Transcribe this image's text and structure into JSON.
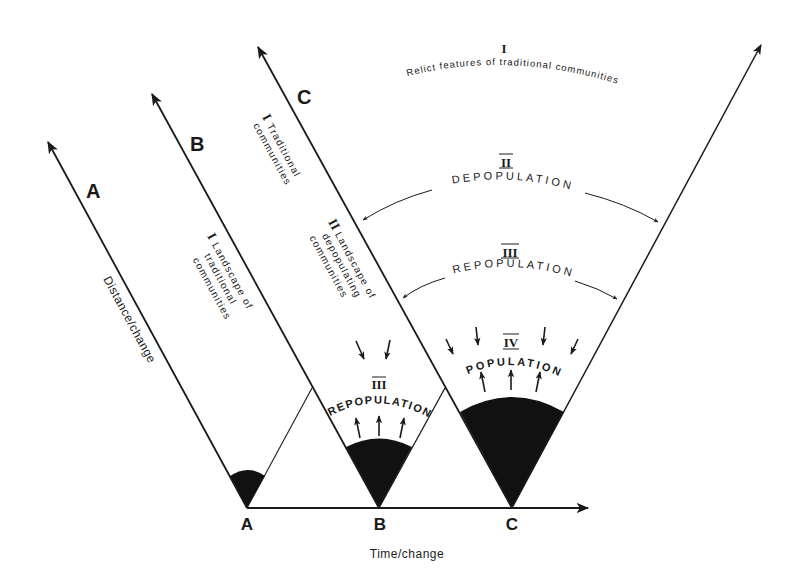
{
  "diagram": {
    "axes": {
      "x_label": "Time/change",
      "y_label": "Distance/change"
    },
    "stages": [
      {
        "id": "A",
        "axis_label": "A",
        "baseline_label": "A"
      },
      {
        "id": "B",
        "axis_label": "B",
        "baseline_label": "B"
      },
      {
        "id": "C",
        "axis_label": "C",
        "baseline_label": "C"
      }
    ],
    "annotations": {
      "b_region": {
        "numeral": "I",
        "line1": "Landscape of",
        "line2": "traditional",
        "line3": "communities"
      },
      "c_upper": {
        "numeral": "I",
        "line1": "Traditional",
        "line2": "communities"
      },
      "c_lower": {
        "numeral": "II",
        "line1": "Landscape of",
        "line2": "depopulating",
        "line3": "communities"
      },
      "b_fan": {
        "numeral": "III",
        "label": "REPOPULATION"
      },
      "c_fan": {
        "numeral": "IV",
        "label": "POPULATION"
      },
      "outer_relict": {
        "numeral": "I",
        "label": "Relict features of traditional communities"
      },
      "outer_depop": {
        "numeral": "II",
        "label": "DEPOPULATION"
      },
      "outer_repop": {
        "numeral": "III",
        "label": "REPOPULATION"
      }
    },
    "colors": {
      "ink": "#1a1a1a",
      "fill": "#111111",
      "background": "#ffffff"
    }
  }
}
